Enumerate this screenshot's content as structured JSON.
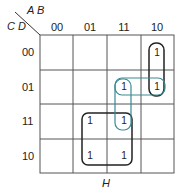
{
  "kmap": {
    "row_var_label": "C D",
    "col_var_label": "A B",
    "col_headers": [
      "00",
      "01",
      "11",
      "10"
    ],
    "row_headers": [
      "00",
      "01",
      "11",
      "10"
    ],
    "cells": [
      [
        "",
        "",
        "",
        "1"
      ],
      [
        "",
        "",
        "1",
        "1"
      ],
      [
        "",
        "1",
        "1",
        ""
      ],
      [
        "",
        "1",
        "1",
        ""
      ]
    ],
    "groups": [
      {
        "name": "quad-group",
        "color": "#222222",
        "cells": [
          [
            2,
            1
          ],
          [
            2,
            2
          ],
          [
            3,
            1
          ],
          [
            3,
            2
          ]
        ]
      },
      {
        "name": "vertical-pair-col10",
        "color": "#222222",
        "cells": [
          [
            0,
            3
          ],
          [
            1,
            3
          ]
        ]
      },
      {
        "name": "horizontal-pair-row01",
        "color": "#3a8a94",
        "cells": [
          [
            1,
            2
          ],
          [
            1,
            3
          ]
        ]
      },
      {
        "name": "vertical-pair-col11",
        "color": "#3a8a94",
        "cells": [
          [
            1,
            2
          ],
          [
            2,
            2
          ]
        ]
      }
    ],
    "caption": "H"
  }
}
